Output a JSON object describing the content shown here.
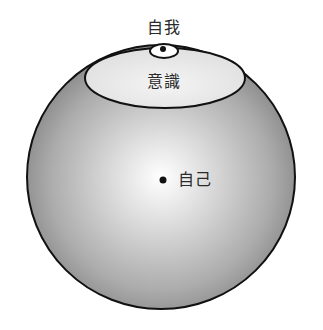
{
  "diagram": {
    "type": "nested-sphere-psyche-model",
    "labels": {
      "ego": "自我",
      "consciousness": "意識",
      "self": "自己"
    },
    "shapes": {
      "psyche_sphere": {
        "cx": 161,
        "cy": 177,
        "rx": 134,
        "ry": 132
      },
      "consciousness_ellipse": {
        "cx": 165,
        "cy": 78,
        "rx": 80,
        "ry": 30
      },
      "ego_ellipse": {
        "cx": 164,
        "cy": 51,
        "rx": 14,
        "ry": 7
      },
      "ego_dot": {
        "cx": 163,
        "cy": 49,
        "r": 3
      },
      "self_dot": {
        "cx": 163,
        "cy": 180,
        "r": 3.5
      }
    },
    "colors": {
      "sphere_highlight": "#ffffff",
      "sphere_mid": "#bdbdbd",
      "sphere_edge": "#8c8c8c",
      "consciousness_fill": "#ececec",
      "outline": "#111111",
      "text": "#2a2a2a"
    }
  }
}
